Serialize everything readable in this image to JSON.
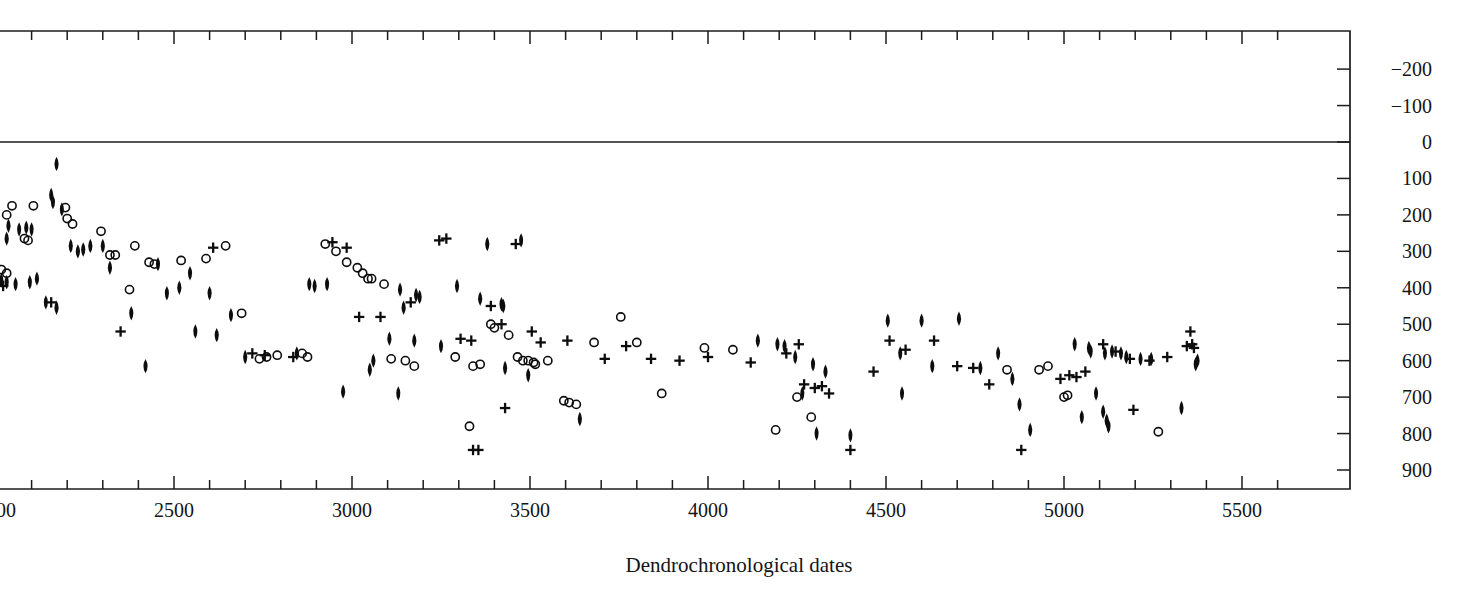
{
  "chart_data": {
    "type": "scatter",
    "title": "",
    "xlabel": "Dendrochronological dates",
    "ylabel": "",
    "xlim": [
      1960,
      5600
    ],
    "ylim": [
      960,
      -250
    ],
    "y_axis_inverted": true,
    "y_axis_position": "right",
    "grid": false,
    "legend": null,
    "zero_reference_line": 0,
    "xticks_major": [
      2000,
      2500,
      3000,
      3500,
      4000,
      4500,
      5000,
      5500
    ],
    "xticks_minor_step": 100,
    "xtick_labels": [
      "2000",
      "2500",
      "3000",
      "3500",
      "4000",
      "4500",
      "5000",
      "5500"
    ],
    "yticks": [
      -200,
      -100,
      0,
      100,
      200,
      300,
      400,
      500,
      600,
      700,
      800,
      900
    ],
    "ytick_labels": [
      "−200",
      "−100",
      "0",
      "100",
      "200",
      "300",
      "400",
      "500",
      "600",
      "700",
      "800",
      "900"
    ],
    "series": [
      {
        "name": "filled-diamond",
        "marker": "diamond",
        "filled": true,
        "points": [
          [
            2170,
            60
          ],
          [
            2155,
            145
          ],
          [
            2160,
            165
          ],
          [
            2185,
            185
          ],
          [
            2035,
            230
          ],
          [
            2065,
            240
          ],
          [
            2085,
            235
          ],
          [
            2100,
            240
          ],
          [
            2030,
            265
          ],
          [
            2210,
            285
          ],
          [
            2265,
            285
          ],
          [
            2300,
            285
          ],
          [
            1990,
            310
          ],
          [
            2015,
            380
          ],
          [
            2030,
            385
          ],
          [
            2055,
            390
          ],
          [
            2095,
            385
          ],
          [
            2115,
            375
          ],
          [
            2320,
            345
          ],
          [
            2455,
            335
          ],
          [
            2545,
            360
          ],
          [
            2515,
            400
          ],
          [
            2480,
            415
          ],
          [
            2600,
            415
          ],
          [
            2140,
            440
          ],
          [
            2170,
            455
          ],
          [
            2380,
            470
          ],
          [
            2660,
            475
          ],
          [
            2560,
            520
          ],
          [
            2620,
            530
          ],
          [
            2700,
            590
          ],
          [
            2420,
            615
          ],
          [
            2880,
            390
          ],
          [
            2895,
            395
          ],
          [
            2930,
            390
          ],
          [
            3135,
            405
          ],
          [
            3180,
            420
          ],
          [
            3190,
            425
          ],
          [
            3145,
            455
          ],
          [
            3295,
            395
          ],
          [
            3380,
            280
          ],
          [
            3475,
            270
          ],
          [
            3360,
            430
          ],
          [
            3420,
            445
          ],
          [
            3425,
            450
          ],
          [
            3105,
            540
          ],
          [
            3175,
            545
          ],
          [
            3250,
            560
          ],
          [
            2845,
            580
          ],
          [
            3060,
            600
          ],
          [
            3050,
            625
          ],
          [
            3430,
            620
          ],
          [
            3495,
            640
          ],
          [
            2975,
            685
          ],
          [
            3130,
            690
          ],
          [
            3640,
            760
          ],
          [
            4140,
            545
          ],
          [
            4195,
            555
          ],
          [
            4215,
            560
          ],
          [
            4245,
            590
          ],
          [
            4295,
            610
          ],
          [
            4330,
            630
          ],
          [
            4265,
            690
          ],
          [
            4305,
            800
          ],
          [
            4400,
            805
          ],
          [
            4505,
            490
          ],
          [
            4600,
            490
          ],
          [
            4705,
            485
          ],
          [
            4540,
            580
          ],
          [
            4630,
            615
          ],
          [
            4545,
            690
          ],
          [
            4815,
            580
          ],
          [
            4765,
            620
          ],
          [
            4855,
            650
          ],
          [
            4875,
            720
          ],
          [
            4905,
            790
          ],
          [
            5030,
            555
          ],
          [
            5070,
            565
          ],
          [
            5075,
            575
          ],
          [
            5115,
            580
          ],
          [
            5135,
            575
          ],
          [
            5160,
            580
          ],
          [
            5175,
            590
          ],
          [
            5215,
            595
          ],
          [
            5245,
            595
          ],
          [
            5375,
            600
          ],
          [
            5370,
            610
          ],
          [
            5090,
            690
          ],
          [
            5110,
            740
          ],
          [
            5120,
            765
          ],
          [
            5125,
            780
          ],
          [
            5050,
            755
          ],
          [
            5330,
            730
          ],
          [
            2230,
            300
          ],
          [
            2245,
            295
          ]
        ]
      },
      {
        "name": "open-circle",
        "marker": "circle",
        "filled": false,
        "points": [
          [
            2045,
            175
          ],
          [
            2105,
            175
          ],
          [
            2030,
            200
          ],
          [
            2195,
            180
          ],
          [
            2200,
            210
          ],
          [
            2215,
            225
          ],
          [
            1985,
            275
          ],
          [
            2080,
            265
          ],
          [
            2090,
            270
          ],
          [
            2295,
            245
          ],
          [
            2320,
            310
          ],
          [
            2335,
            310
          ],
          [
            2390,
            285
          ],
          [
            2430,
            330
          ],
          [
            2445,
            335
          ],
          [
            2520,
            325
          ],
          [
            2590,
            320
          ],
          [
            2645,
            285
          ],
          [
            2015,
            350
          ],
          [
            2030,
            360
          ],
          [
            2375,
            405
          ],
          [
            2690,
            470
          ],
          [
            2790,
            585
          ],
          [
            2860,
            580
          ],
          [
            2875,
            590
          ],
          [
            2925,
            280
          ],
          [
            2955,
            300
          ],
          [
            2985,
            330
          ],
          [
            3015,
            345
          ],
          [
            3030,
            360
          ],
          [
            3045,
            375
          ],
          [
            3055,
            375
          ],
          [
            3090,
            390
          ],
          [
            3110,
            595
          ],
          [
            3150,
            600
          ],
          [
            3175,
            615
          ],
          [
            3290,
            590
          ],
          [
            3330,
            780
          ],
          [
            3340,
            615
          ],
          [
            3360,
            610
          ],
          [
            3390,
            500
          ],
          [
            3400,
            510
          ],
          [
            3440,
            530
          ],
          [
            3465,
            590
          ],
          [
            3480,
            600
          ],
          [
            3495,
            600
          ],
          [
            3510,
            605
          ],
          [
            3515,
            610
          ],
          [
            3550,
            600
          ],
          [
            3595,
            710
          ],
          [
            3610,
            715
          ],
          [
            3630,
            720
          ],
          [
            3680,
            550
          ],
          [
            3755,
            480
          ],
          [
            3800,
            550
          ],
          [
            3870,
            690
          ],
          [
            3990,
            565
          ],
          [
            4070,
            570
          ],
          [
            4250,
            700
          ],
          [
            4290,
            755
          ],
          [
            4190,
            790
          ],
          [
            4840,
            625
          ],
          [
            4930,
            625
          ],
          [
            4955,
            615
          ],
          [
            5000,
            700
          ],
          [
            5010,
            695
          ],
          [
            5265,
            795
          ],
          [
            2740,
            595
          ],
          [
            2760,
            590
          ]
        ]
      },
      {
        "name": "plus",
        "marker": "plus",
        "points": [
          [
            2020,
            395
          ],
          [
            2155,
            440
          ],
          [
            2350,
            520
          ],
          [
            2610,
            290
          ],
          [
            2720,
            580
          ],
          [
            2755,
            585
          ],
          [
            2835,
            590
          ],
          [
            2945,
            275
          ],
          [
            2985,
            290
          ],
          [
            3020,
            480
          ],
          [
            3080,
            480
          ],
          [
            3165,
            440
          ],
          [
            3245,
            270
          ],
          [
            3265,
            265
          ],
          [
            3305,
            540
          ],
          [
            3335,
            545
          ],
          [
            3340,
            845
          ],
          [
            3355,
            845
          ],
          [
            3390,
            450
          ],
          [
            3420,
            500
          ],
          [
            3430,
            730
          ],
          [
            3460,
            280
          ],
          [
            3505,
            520
          ],
          [
            3530,
            550
          ],
          [
            3605,
            545
          ],
          [
            3710,
            595
          ],
          [
            3770,
            560
          ],
          [
            3840,
            595
          ],
          [
            3920,
            600
          ],
          [
            4000,
            590
          ],
          [
            4120,
            605
          ],
          [
            4220,
            580
          ],
          [
            4255,
            555
          ],
          [
            4270,
            665
          ],
          [
            4300,
            675
          ],
          [
            4320,
            670
          ],
          [
            4340,
            690
          ],
          [
            4400,
            845
          ],
          [
            4465,
            630
          ],
          [
            4510,
            545
          ],
          [
            4555,
            570
          ],
          [
            4635,
            545
          ],
          [
            4700,
            615
          ],
          [
            4745,
            620
          ],
          [
            4790,
            665
          ],
          [
            4880,
            845
          ],
          [
            4990,
            650
          ],
          [
            5015,
            640
          ],
          [
            5035,
            645
          ],
          [
            5060,
            630
          ],
          [
            5110,
            555
          ],
          [
            5145,
            575
          ],
          [
            5185,
            595
          ],
          [
            5240,
            600
          ],
          [
            5290,
            590
          ],
          [
            5345,
            560
          ],
          [
            5360,
            555
          ],
          [
            5365,
            565
          ],
          [
            5195,
            735
          ],
          [
            5355,
            520
          ]
        ]
      }
    ]
  },
  "axis": {
    "x_title": "Dendrochronological dates"
  }
}
